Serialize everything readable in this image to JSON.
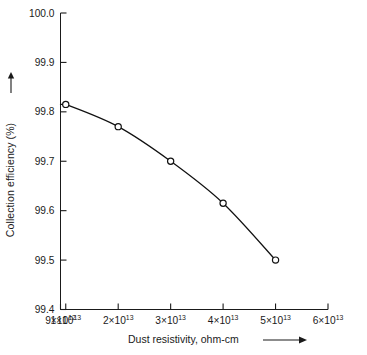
{
  "chart_data": {
    "type": "line",
    "title": "",
    "xlabel": "Dust resistivity, ohm-cm",
    "ylabel": "Collection efficiency (%)",
    "xlabel_arrow": "right-arrow",
    "ylabel_arrow": "up-arrow",
    "grid": false,
    "legend": "none",
    "marker": "open-circle",
    "line_color": "#111111",
    "xscale": "linear-in-resistivity",
    "xlim": [
      9000000000000.0,
      60000000000000.0
    ],
    "ylim": [
      99.4,
      100.0
    ],
    "x_tick_labels": [
      {
        "mantissa": "9",
        "exponent": "12",
        "value": 9000000000000.0
      },
      {
        "mantissa": "1",
        "exponent": "13",
        "value": 10000000000000.0
      },
      {
        "mantissa": "2",
        "exponent": "13",
        "value": 20000000000000.0
      },
      {
        "mantissa": "3",
        "exponent": "13",
        "value": 30000000000000.0
      },
      {
        "mantissa": "4",
        "exponent": "13",
        "value": 40000000000000.0
      },
      {
        "mantissa": "5",
        "exponent": "13",
        "value": 50000000000000.0
      },
      {
        "mantissa": "6",
        "exponent": "13",
        "value": 60000000000000.0
      }
    ],
    "y_tick_labels": [
      "99.4",
      "99.5",
      "99.6",
      "99.7",
      "99.8",
      "99.9",
      "100.0"
    ],
    "y_tick_values": [
      99.4,
      99.5,
      99.6,
      99.7,
      99.8,
      99.9,
      100.0
    ],
    "series": [
      {
        "name": "collection efficiency",
        "x": [
          10000000000000.0,
          20000000000000.0,
          30000000000000.0,
          40000000000000.0,
          50000000000000.0
        ],
        "values": [
          99.815,
          99.77,
          99.7,
          99.615,
          99.5
        ]
      }
    ],
    "flat_lead_in": {
      "from_x": 9000000000000.0,
      "to_x": 10000000000000.0,
      "y": 99.815
    }
  },
  "axes": {
    "x_axis_name": "dust-resistivity-axis",
    "y_axis_name": "collection-efficiency-axis"
  }
}
